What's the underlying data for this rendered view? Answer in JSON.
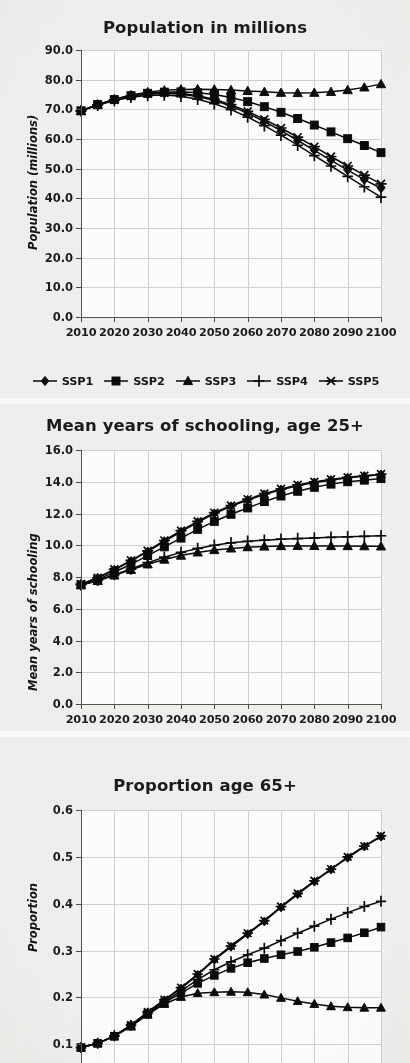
{
  "figure": {
    "background_color": "#f1f0ee",
    "plot_background_color": "#ffffff",
    "series_color": "#0a0a0a",
    "gridline_color": "#d3d3d0"
  },
  "legend": {
    "position": "below-first-chart",
    "entries": [
      {
        "label": "SSP1",
        "marker": "diamond"
      },
      {
        "label": "SSP2",
        "marker": "square"
      },
      {
        "label": "SSP3",
        "marker": "triangle"
      },
      {
        "label": "SSP4",
        "marker": "plus"
      },
      {
        "label": "SSP5",
        "marker": "asterisk"
      }
    ]
  },
  "chart_data": [
    {
      "type": "line",
      "title": "Population in millions",
      "xlabel": "",
      "ylabel": "Population (millions)",
      "xlim": [
        2010,
        2100
      ],
      "ylim": [
        0.0,
        90.0
      ],
      "ytick_labels": [
        "0.0",
        "10.0",
        "20.0",
        "30.0",
        "40.0",
        "50.0",
        "60.0",
        "70.0",
        "80.0",
        "90.0"
      ],
      "yticks": [
        0.0,
        10.0,
        20.0,
        30.0,
        40.0,
        50.0,
        60.0,
        70.0,
        80.0,
        90.0
      ],
      "xtick_labels": [
        "2010",
        "2020",
        "2030",
        "2040",
        "2050",
        "2060",
        "2070",
        "2080",
        "2090",
        "2100"
      ],
      "xticks": [
        2010,
        2020,
        2030,
        2040,
        2050,
        2060,
        2070,
        2080,
        2090,
        2100
      ],
      "grid": true,
      "x": [
        2010,
        2015,
        2020,
        2025,
        2030,
        2035,
        2040,
        2045,
        2050,
        2055,
        2060,
        2065,
        2070,
        2075,
        2080,
        2085,
        2090,
        2095,
        2100
      ],
      "series": [
        {
          "name": "SSP1",
          "marker": "diamond",
          "values": [
            69.5,
            71.5,
            73.2,
            74.4,
            75.1,
            75.4,
            75.1,
            74.3,
            73.0,
            71.1,
            68.7,
            65.9,
            62.8,
            59.5,
            56.2,
            52.8,
            49.5,
            46.3,
            43.4
          ]
        },
        {
          "name": "SSP2",
          "marker": "square",
          "values": [
            69.5,
            71.6,
            73.3,
            74.6,
            75.4,
            75.8,
            75.9,
            75.6,
            75.0,
            74.0,
            72.6,
            70.9,
            69.0,
            66.9,
            64.7,
            62.4,
            60.1,
            57.8,
            55.4
          ]
        },
        {
          "name": "SSP3",
          "marker": "triangle",
          "values": [
            69.5,
            71.6,
            73.4,
            74.8,
            75.8,
            76.4,
            76.7,
            76.8,
            76.7,
            76.5,
            76.2,
            75.9,
            75.6,
            75.5,
            75.6,
            75.9,
            76.5,
            77.4,
            78.5
          ]
        },
        {
          "name": "SSP4",
          "marker": "plus",
          "values": [
            69.5,
            71.4,
            73.0,
            74.1,
            74.7,
            74.8,
            74.4,
            73.4,
            71.9,
            69.9,
            67.4,
            64.5,
            61.3,
            57.9,
            54.4,
            50.9,
            47.4,
            43.9,
            40.4
          ]
        },
        {
          "name": "SSP5",
          "marker": "asterisk",
          "values": [
            69.5,
            71.5,
            73.2,
            74.5,
            75.3,
            75.6,
            75.4,
            74.6,
            73.4,
            71.6,
            69.3,
            66.6,
            63.7,
            60.6,
            57.4,
            54.1,
            50.9,
            47.8,
            44.9
          ]
        }
      ]
    },
    {
      "type": "line",
      "title": "Mean years of schooling, age 25+",
      "xlabel": "",
      "ylabel": "Mean years of schooling",
      "xlim": [
        2010,
        2100
      ],
      "ylim": [
        0.0,
        16.0
      ],
      "ytick_labels": [
        "0.0",
        "2.0",
        "4.0",
        "6.0",
        "8.0",
        "10.0",
        "12.0",
        "14.0",
        "16.0"
      ],
      "yticks": [
        0.0,
        2.0,
        4.0,
        6.0,
        8.0,
        10.0,
        12.0,
        14.0,
        16.0
      ],
      "xtick_labels": [
        "2010",
        "2020",
        "2030",
        "2040",
        "2050",
        "2060",
        "2070",
        "2080",
        "2090",
        "2100"
      ],
      "xticks": [
        2010,
        2020,
        2030,
        2040,
        2050,
        2060,
        2070,
        2080,
        2090,
        2100
      ],
      "grid": true,
      "x": [
        2010,
        2015,
        2020,
        2025,
        2030,
        2035,
        2040,
        2045,
        2050,
        2055,
        2060,
        2065,
        2070,
        2075,
        2080,
        2085,
        2090,
        2095,
        2100
      ],
      "series": [
        {
          "name": "SSP1",
          "marker": "diamond",
          "values": [
            7.55,
            7.95,
            8.45,
            9.0,
            9.6,
            10.25,
            10.85,
            11.45,
            12.0,
            12.45,
            12.85,
            13.2,
            13.5,
            13.75,
            13.95,
            14.1,
            14.25,
            14.35,
            14.45
          ]
        },
        {
          "name": "SSP2",
          "marker": "square",
          "values": [
            7.5,
            7.85,
            8.3,
            8.8,
            9.35,
            9.9,
            10.45,
            11.0,
            11.5,
            11.95,
            12.35,
            12.75,
            13.1,
            13.4,
            13.65,
            13.85,
            14.0,
            14.1,
            14.2
          ]
        },
        {
          "name": "SSP3",
          "marker": "triangle",
          "values": [
            7.5,
            7.75,
            8.1,
            8.45,
            8.8,
            9.1,
            9.35,
            9.55,
            9.7,
            9.8,
            9.88,
            9.92,
            9.95,
            9.96,
            9.96,
            9.95,
            9.95,
            9.94,
            9.93
          ]
        },
        {
          "name": "SSP4",
          "marker": "plus",
          "values": [
            7.5,
            7.8,
            8.15,
            8.5,
            8.9,
            9.25,
            9.55,
            9.8,
            10.0,
            10.15,
            10.25,
            10.32,
            10.38,
            10.42,
            10.46,
            10.5,
            10.53,
            10.56,
            10.6
          ]
        },
        {
          "name": "SSP5",
          "marker": "asterisk",
          "values": [
            7.55,
            7.95,
            8.48,
            9.05,
            9.65,
            10.3,
            10.92,
            11.5,
            12.05,
            12.5,
            12.9,
            13.25,
            13.55,
            13.8,
            14.0,
            14.15,
            14.28,
            14.38,
            14.48
          ]
        }
      ]
    },
    {
      "type": "line",
      "title": "Proportion age 65+",
      "xlabel": "",
      "ylabel": "Proportion",
      "xlim": [
        2010,
        2100
      ],
      "ylim": [
        0.06,
        0.6
      ],
      "ytick_labels": [
        "0.1",
        "0.2",
        "0.3",
        "0.4",
        "0.5",
        "0.6"
      ],
      "yticks": [
        0.1,
        0.2,
        0.3,
        0.4,
        0.5,
        0.6
      ],
      "xtick_labels": [
        "2010",
        "2020",
        "2030",
        "2040",
        "2050",
        "2060",
        "2070",
        "2080",
        "2090",
        "2100"
      ],
      "xticks": [
        2010,
        2020,
        2030,
        2040,
        2050,
        2060,
        2070,
        2080,
        2090,
        2100
      ],
      "grid": true,
      "cropped_at_bottom": true,
      "x": [
        2010,
        2015,
        2020,
        2025,
        2030,
        2035,
        2040,
        2045,
        2050,
        2055,
        2060,
        2065,
        2070,
        2075,
        2080,
        2085,
        2090,
        2095,
        2100
      ],
      "series": [
        {
          "name": "SSP1",
          "marker": "diamond",
          "values": [
            0.093,
            0.102,
            0.118,
            0.141,
            0.168,
            0.194,
            0.219,
            0.248,
            0.28,
            0.308,
            0.335,
            0.362,
            0.392,
            0.42,
            0.447,
            0.473,
            0.498,
            0.522,
            0.543
          ]
        },
        {
          "name": "SSP2",
          "marker": "square",
          "values": [
            0.093,
            0.102,
            0.117,
            0.139,
            0.165,
            0.189,
            0.209,
            0.23,
            0.247,
            0.262,
            0.274,
            0.283,
            0.291,
            0.298,
            0.307,
            0.317,
            0.327,
            0.338,
            0.35
          ]
        },
        {
          "name": "SSP3",
          "marker": "triangle",
          "values": [
            0.093,
            0.102,
            0.117,
            0.138,
            0.163,
            0.186,
            0.201,
            0.209,
            0.211,
            0.212,
            0.211,
            0.206,
            0.199,
            0.192,
            0.186,
            0.181,
            0.179,
            0.178,
            0.178
          ]
        },
        {
          "name": "SSP4",
          "marker": "plus",
          "values": [
            0.093,
            0.102,
            0.118,
            0.14,
            0.166,
            0.191,
            0.214,
            0.238,
            0.259,
            0.276,
            0.291,
            0.305,
            0.321,
            0.337,
            0.352,
            0.367,
            0.381,
            0.394,
            0.405
          ]
        },
        {
          "name": "SSP5",
          "marker": "asterisk",
          "values": [
            0.093,
            0.102,
            0.118,
            0.141,
            0.169,
            0.195,
            0.221,
            0.25,
            0.282,
            0.31,
            0.337,
            0.364,
            0.394,
            0.422,
            0.449,
            0.474,
            0.5,
            0.523,
            0.545
          ]
        }
      ]
    }
  ]
}
